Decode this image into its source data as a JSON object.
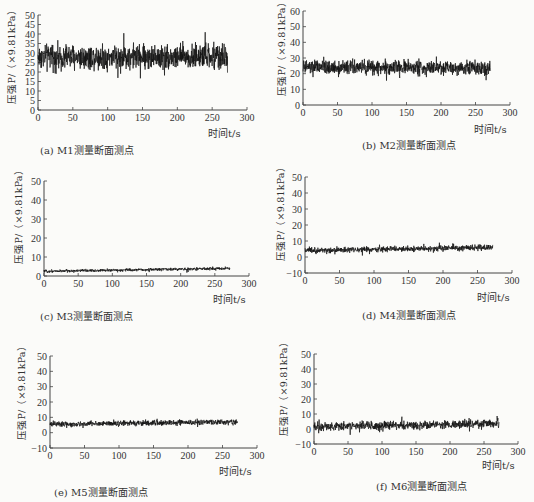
{
  "chart_data": [
    {
      "id": "a",
      "type": "line",
      "caption": "(a) M1测量断面测点",
      "xlabel": "时间t/s",
      "ylabel": "压强P/（×9.81kPa）",
      "xlim": [
        0,
        300
      ],
      "ylim": [
        0,
        50
      ],
      "xticks": [
        0,
        50,
        100,
        150,
        200,
        250,
        300
      ],
      "yticks": [
        0,
        5,
        10,
        15,
        20,
        25,
        30,
        35,
        40,
        45,
        50
      ],
      "series": [
        {
          "name": "M1",
          "x_range": [
            0,
            272
          ],
          "mean": 28,
          "amplitude_min": 12,
          "amplitude_max": 47,
          "trend": 0
        }
      ],
      "grid": false
    },
    {
      "id": "b",
      "type": "line",
      "caption": "(b) M2测量断面测点",
      "xlabel": "时间t/s",
      "ylabel": "压强P/（×9.81kPa）",
      "xlim": [
        0,
        300
      ],
      "ylim": [
        0,
        60
      ],
      "xticks": [
        0,
        50,
        100,
        150,
        200,
        250,
        300
      ],
      "yticks": [
        0,
        10,
        20,
        30,
        40,
        50,
        60
      ],
      "series": [
        {
          "name": "M2",
          "x_range": [
            0,
            272
          ],
          "mean": 24,
          "amplitude_min": 11,
          "amplitude_max": 35,
          "trend": 0
        }
      ],
      "grid": false
    },
    {
      "id": "c",
      "type": "line",
      "caption": "(c) M3测量断面测点",
      "xlabel": "时间t/s",
      "ylabel": "压强P/（×9.81kPa）",
      "xlim": [
        0,
        300
      ],
      "ylim": [
        0,
        50
      ],
      "xticks": [
        0,
        50,
        100,
        150,
        200,
        250,
        300
      ],
      "yticks": [
        0,
        10,
        20,
        30,
        40,
        50
      ],
      "series": [
        {
          "name": "M3",
          "x_range": [
            0,
            272
          ],
          "mean": 2.5,
          "amplitude_min": 1,
          "amplitude_max": 5,
          "trend": 1.5
        }
      ],
      "grid": false
    },
    {
      "id": "d",
      "type": "line",
      "caption": "(d) M4测量断面测点",
      "xlabel": "时间t/s",
      "ylabel": "压强P/（×9.81kPa）",
      "xlim": [
        0,
        300
      ],
      "ylim": [
        -10,
        50
      ],
      "xticks": [
        0,
        50,
        100,
        150,
        200,
        250,
        300
      ],
      "yticks": [
        -10,
        0,
        10,
        20,
        30,
        40,
        50
      ],
      "series": [
        {
          "name": "M4",
          "x_range": [
            0,
            272
          ],
          "mean": 4,
          "amplitude_min": 0,
          "amplitude_max": 9,
          "trend": 2
        }
      ],
      "grid": false
    },
    {
      "id": "e",
      "type": "line",
      "caption": "(e) M5测量断面测点",
      "xlabel": "时间t/s",
      "ylabel": "压强P/（×9.81kPa）",
      "xlim": [
        0,
        300
      ],
      "ylim": [
        -10,
        50
      ],
      "xticks": [
        0,
        50,
        100,
        150,
        200,
        250,
        300
      ],
      "yticks": [
        -10,
        0,
        10,
        20,
        30,
        40,
        50
      ],
      "series": [
        {
          "name": "M5",
          "x_range": [
            0,
            272
          ],
          "mean": 5.5,
          "amplitude_min": 1,
          "amplitude_max": 10,
          "trend": 1.5
        }
      ],
      "grid": false
    },
    {
      "id": "f",
      "type": "line",
      "caption": "(f) M6测量断面测点",
      "xlabel": "时间t/s",
      "ylabel": "压强P/（×9.81kPa）",
      "xlim": [
        0,
        300
      ],
      "ylim": [
        -10,
        50
      ],
      "xticks": [
        0,
        50,
        100,
        150,
        200,
        250,
        300
      ],
      "yticks": [
        -10,
        0,
        10,
        20,
        30,
        40,
        50
      ],
      "series": [
        {
          "name": "M6",
          "x_range": [
            0,
            272
          ],
          "mean": 1.5,
          "amplitude_min": -5,
          "amplitude_max": 10,
          "trend": 2
        }
      ],
      "grid": false
    }
  ],
  "layout": {
    "panels": [
      {
        "id": "a",
        "axis_left": 38,
        "axis_right": 247,
        "y_top": 15,
        "y_bottom": 110,
        "xaxis_y": 110,
        "ylabel_x": 4,
        "ylabel_y": 104,
        "xlabel_x": 208,
        "xlabel_y": 125,
        "caption_x": 40,
        "caption_y": 142
      },
      {
        "id": "b",
        "axis_left": 303,
        "axis_right": 510,
        "y_top": 11,
        "y_bottom": 105,
        "xaxis_y": 105,
        "ylabel_x": 274,
        "ylabel_y": 96,
        "xlabel_x": 474,
        "xlabel_y": 121,
        "caption_x": 362,
        "caption_y": 137
      },
      {
        "id": "c",
        "axis_left": 44,
        "axis_right": 249,
        "y_top": 181,
        "y_bottom": 276,
        "xaxis_y": 276,
        "ylabel_x": 11,
        "ylabel_y": 264,
        "xlabel_x": 213,
        "xlabel_y": 291,
        "caption_x": 40,
        "caption_y": 308
      },
      {
        "id": "d",
        "axis_left": 305,
        "axis_right": 512,
        "y_top": 177,
        "y_bottom": 273,
        "xaxis_y": 273,
        "ylabel_x": 273,
        "ylabel_y": 261,
        "xlabel_x": 477,
        "xlabel_y": 289,
        "caption_x": 362,
        "caption_y": 307
      },
      {
        "id": "e",
        "axis_left": 50,
        "axis_right": 257,
        "y_top": 356,
        "y_bottom": 448,
        "xaxis_y": 448,
        "ylabel_x": 14,
        "ylabel_y": 440,
        "xlabel_x": 219,
        "xlabel_y": 463,
        "caption_x": 54,
        "caption_y": 484
      },
      {
        "id": "f",
        "axis_left": 314,
        "axis_right": 518,
        "y_top": 354,
        "y_bottom": 444,
        "xaxis_y": 444,
        "ylabel_x": 276,
        "ylabel_y": 436,
        "xlabel_x": 482,
        "xlabel_y": 457,
        "caption_x": 376,
        "caption_y": 478
      }
    ],
    "colors": {
      "line": "#111111",
      "axis": "#444444",
      "background": "#fbfbf9"
    }
  }
}
